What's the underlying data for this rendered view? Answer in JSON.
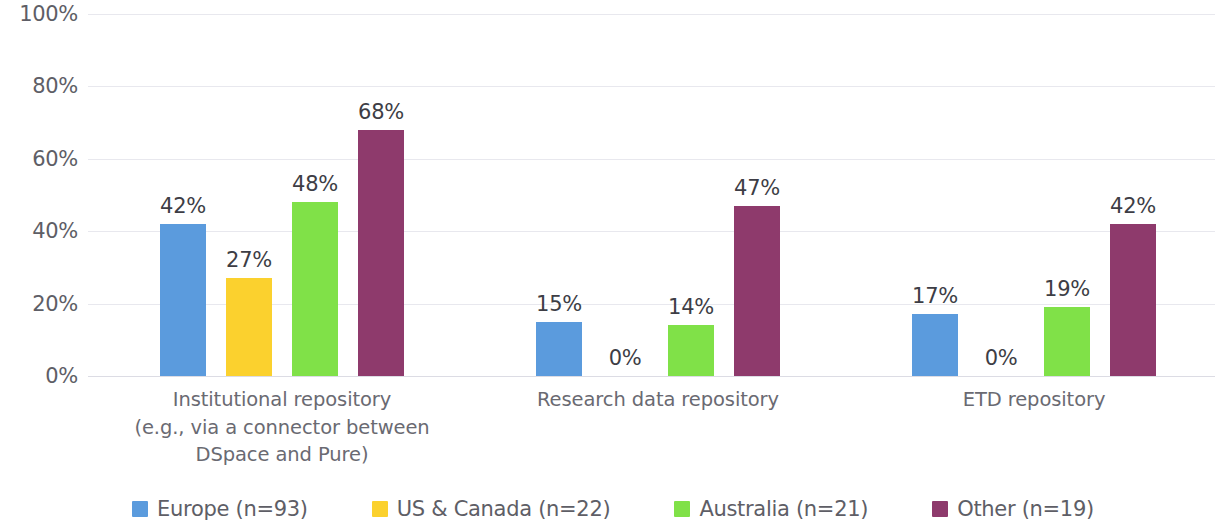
{
  "chart_data": {
    "type": "bar",
    "title": "",
    "subtitle": "",
    "xlabel": "",
    "ylabel": "",
    "ylim": [
      0,
      100
    ],
    "y_tick_labels": [
      "0%",
      "20%",
      "40%",
      "60%",
      "80%",
      "100%"
    ],
    "y_tick_values": [
      0,
      20,
      40,
      60,
      80,
      100
    ],
    "grid": true,
    "legend_position": "bottom",
    "value_suffix": "%",
    "categories": [
      "Institutional repository (e.g., via a connector between DSpace and Pure)",
      "Research data repository",
      "ETD repository"
    ],
    "category_lines": [
      [
        "Institutional repository",
        "(e.g., via a connector between",
        "DSpace and Pure)"
      ],
      [
        "Research data repository"
      ],
      [
        "ETD repository"
      ]
    ],
    "series": [
      {
        "name": "Europe (n=93)",
        "color": "#5B9BDD",
        "values": [
          42,
          15,
          17
        ],
        "labels": [
          "42%",
          "15%",
          "17%"
        ]
      },
      {
        "name": "US & Canada (n=22)",
        "color": "#FBD12E",
        "values": [
          27,
          0,
          0
        ],
        "labels": [
          "27%",
          "0%",
          "0%"
        ]
      },
      {
        "name": "Australia (n=21)",
        "color": "#80E148",
        "values": [
          48,
          14,
          19
        ],
        "labels": [
          "48%",
          "14%",
          "19%"
        ]
      },
      {
        "name": "Other (n=19)",
        "color": "#8E3A6C",
        "values": [
          68,
          47,
          42
        ],
        "labels": [
          "68%",
          "47%",
          "42%"
        ]
      }
    ],
    "legend": [
      {
        "label": "Europe (n=93)",
        "color": "#5B9BDD"
      },
      {
        "label": "US & Canada (n=22)",
        "color": "#FBD12E"
      },
      {
        "label": "Australia (n=21)",
        "color": "#80E148"
      },
      {
        "label": "Other (n=19)",
        "color": "#8E3A6C"
      }
    ]
  }
}
